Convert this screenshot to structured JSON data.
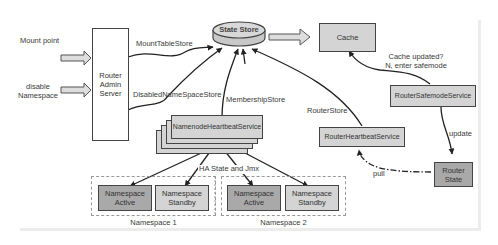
{
  "inputs": {
    "mount_point": "Mount point",
    "disable_namespace_line1": "disable",
    "disable_namespace_line2": "Namespace"
  },
  "router_admin_server": {
    "line1": "Router",
    "line2": "Admin",
    "line3": "Server"
  },
  "state_store": "State Store",
  "cache": "Cache",
  "edge_labels": {
    "mount_table_store": "MountTableStore",
    "disabled_namespace_store": "DisabledNameSpaceStore",
    "membership_store": "MembershipStore",
    "router_store": "RouterStore",
    "cache_updated_line1": "Cache updated?",
    "cache_updated_line2": "N, enter safemode",
    "ha_state_and_jmx": "HA State and Jmx",
    "update": "update",
    "pull": "pull"
  },
  "namenode_heartbeat_service": "NamenodeHeartbeatService",
  "router_heartbeat_service": "RouterHeartbeatService",
  "router_safemode_service": "RouterSafemodeService",
  "router_state": {
    "line1": "Router",
    "line2": "State"
  },
  "namespaces": [
    {
      "label": "Namespace 1",
      "active": {
        "line1": "Namespace",
        "line2": "Active"
      },
      "standby": {
        "line1": "Namespace",
        "line2": "Standby"
      }
    },
    {
      "label": "Namespace 2",
      "active": {
        "line1": "Namespace",
        "line2": "Active"
      },
      "standby": {
        "line1": "Namespace",
        "line2": "Standby"
      }
    }
  ],
  "colors": {
    "box_gray": "#d4d4d4",
    "box_dark": "#a9a9a9",
    "stroke": "#444444"
  }
}
